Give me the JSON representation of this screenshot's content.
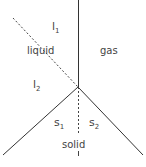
{
  "diagram": {
    "type": "phase-diagram",
    "regions": {
      "l1": "l",
      "l1_sub": "1",
      "liquid": "liquid",
      "l2": "l",
      "l2_sub": "2",
      "gas": "gas",
      "s1": "s",
      "s1_sub": "1",
      "s2": "s",
      "s2_sub": "2",
      "solid": "solid"
    },
    "colors": {
      "line": "#333333",
      "text": "#444444"
    }
  }
}
